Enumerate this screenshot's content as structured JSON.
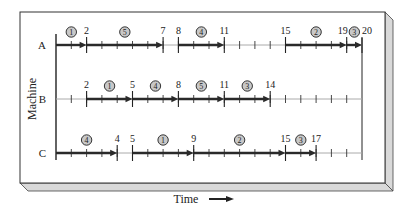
{
  "chart_data": {
    "type": "gantt",
    "title": "",
    "xlabel": "Time",
    "ylabel": "Machine",
    "xlim": [
      0,
      20
    ],
    "tick_interval": 1,
    "machines": [
      {
        "name": "A",
        "jobs": [
          {
            "job": 1,
            "start": 0,
            "end": 2
          },
          {
            "job": 5,
            "start": 2,
            "end": 7
          },
          {
            "job": 4,
            "start": 8,
            "end": 11
          },
          {
            "job": 2,
            "start": 15,
            "end": 19
          },
          {
            "job": 3,
            "start": 19,
            "end": 20
          }
        ],
        "time_labels": [
          2,
          7,
          8,
          11,
          15,
          19,
          20
        ]
      },
      {
        "name": "B",
        "jobs": [
          {
            "job": 1,
            "start": 2,
            "end": 5
          },
          {
            "job": 4,
            "start": 5,
            "end": 8
          },
          {
            "job": 5,
            "start": 8,
            "end": 11
          },
          {
            "job": 3,
            "start": 11,
            "end": 14
          }
        ],
        "time_labels": [
          2,
          5,
          8,
          11,
          14
        ]
      },
      {
        "name": "C",
        "jobs": [
          {
            "job": 4,
            "start": 0,
            "end": 4
          },
          {
            "job": 1,
            "start": 5,
            "end": 9
          },
          {
            "job": 2,
            "start": 9,
            "end": 15
          },
          {
            "job": 3,
            "start": 15,
            "end": 17
          }
        ],
        "time_labels": [
          4,
          5,
          9,
          15,
          17
        ]
      }
    ]
  },
  "labels": {
    "y_axis": "Machine",
    "x_axis": "Time"
  },
  "colors": {
    "job_bar": "#2a2a2a",
    "idle_line": "#aaaaaa",
    "frame": "#333333",
    "bevel": "#d8d8d8"
  }
}
